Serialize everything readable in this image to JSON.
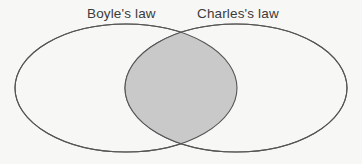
{
  "figure": {
    "type": "venn-diagram",
    "width": 362,
    "height": 164,
    "background_color": "#f7f7f5"
  },
  "colors": {
    "stroke": "#555555",
    "intersection_fill": "#c9c9c9",
    "set_fill": "#f7f7f5",
    "label_text": "#3b3b3b"
  },
  "sets": [
    {
      "id": "left",
      "label": "Boyle's law",
      "center_x": 126,
      "center_y": 88,
      "rx": 111,
      "ry": 64,
      "fill": "#f7f7f5"
    },
    {
      "id": "right",
      "label": "Charles's law",
      "center_x": 236,
      "center_y": 88,
      "rx": 111,
      "ry": 64,
      "fill": "#f7f7f5"
    }
  ],
  "intersection": {
    "label": "",
    "fill": "#c9c9c9",
    "left_x": 126,
    "right_x": 237,
    "top_point": {
      "x": 181,
      "y": 27
    },
    "bottom_point": {
      "x": 181,
      "y": 150
    }
  }
}
